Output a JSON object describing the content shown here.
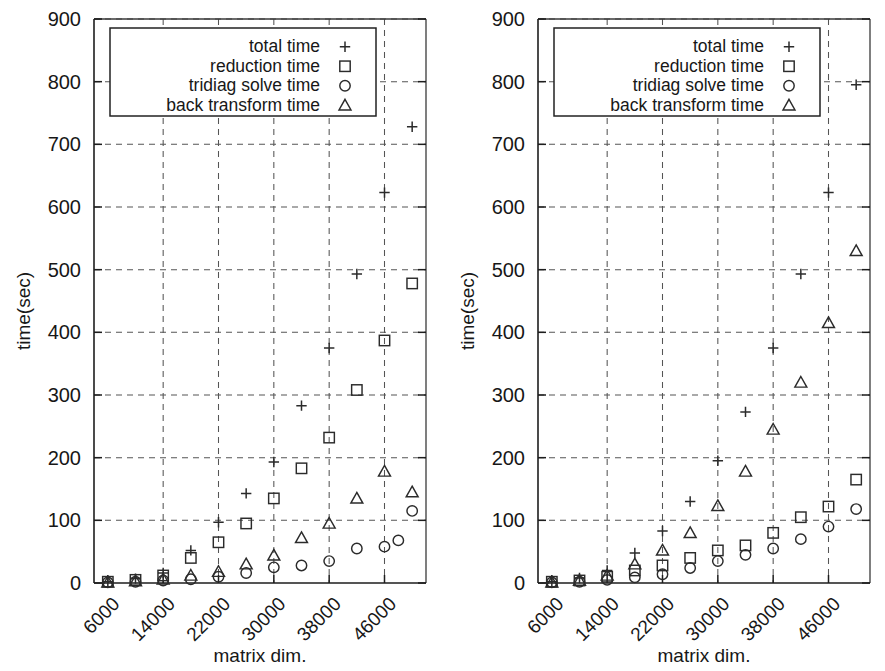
{
  "figure": {
    "panel_count": 2,
    "background_color": "#ffffff",
    "ink_color": "#1d1d1d"
  },
  "series_names": [
    "total time",
    "reduction time",
    "tridiag solve time",
    "back transform time"
  ],
  "series_markers": [
    "plus-marker",
    "square-marker",
    "circle-marker",
    "triangle-marker"
  ],
  "chart_data": [
    {
      "type": "scatter",
      "title": "",
      "xlabel": "matrix dim.",
      "ylabel": "time(sec)",
      "xlim": [
        4000,
        52000
      ],
      "ylim": [
        0,
        900
      ],
      "xticks": [
        6000,
        14000,
        22000,
        30000,
        38000,
        46000
      ],
      "yticks": [
        0,
        100,
        200,
        300,
        400,
        500,
        600,
        700,
        800,
        900
      ],
      "xtick_labels": [
        "6000",
        "14000",
        "22000",
        "30000",
        "38000",
        "46000"
      ],
      "ytick_labels": [
        "0",
        "100",
        "200",
        "300",
        "400",
        "500",
        "600",
        "700",
        "800",
        "900"
      ],
      "grid": true,
      "legend_position": "top-center",
      "legend_entries": [
        "total time",
        "reduction time",
        "tridiag solve time",
        "back transform time"
      ],
      "x": [
        6000,
        10000,
        14000,
        18000,
        22000,
        26000,
        30000,
        34000,
        38000,
        42000,
        46000,
        50000
      ],
      "series": [
        {
          "name": "total time",
          "marker": "plus-marker",
          "values": [
            2,
            6,
            14,
            30,
            52,
            95,
            143,
            193,
            283,
            375,
            493,
            623,
            728
          ]
        },
        {
          "name": "reduction time",
          "marker": "square-marker",
          "values": [
            2,
            5,
            11,
            22,
            40,
            65,
            95,
            135,
            183,
            232,
            308,
            387,
            478
          ]
        },
        {
          "name": "tridiag solve time",
          "marker": "circle-marker",
          "values": [
            1,
            2,
            4,
            6,
            9,
            13,
            19,
            26,
            31,
            38,
            55,
            58,
            68,
            115
          ]
        },
        {
          "name": "back transform time",
          "marker": "triangle-marker",
          "values": [
            1,
            3,
            6,
            10,
            16,
            22,
            30,
            44,
            72,
            95,
            135,
            178,
            145
          ]
        }
      ],
      "points": [
        {
          "series": 0,
          "x": 6000,
          "y": 2
        },
        {
          "series": 0,
          "x": 10000,
          "y": 7
        },
        {
          "series": 0,
          "x": 14000,
          "y": 16
        },
        {
          "series": 0,
          "x": 18000,
          "y": 52
        },
        {
          "series": 0,
          "x": 22000,
          "y": 97
        },
        {
          "series": 0,
          "x": 26000,
          "y": 143
        },
        {
          "series": 0,
          "x": 30000,
          "y": 193
        },
        {
          "series": 0,
          "x": 34000,
          "y": 283
        },
        {
          "series": 0,
          "x": 38000,
          "y": 375
        },
        {
          "series": 0,
          "x": 42000,
          "y": 493
        },
        {
          "series": 0,
          "x": 46000,
          "y": 623
        },
        {
          "series": 0,
          "x": 50000,
          "y": 728
        },
        {
          "series": 1,
          "x": 6000,
          "y": 2
        },
        {
          "series": 1,
          "x": 10000,
          "y": 5
        },
        {
          "series": 1,
          "x": 14000,
          "y": 12
        },
        {
          "series": 1,
          "x": 18000,
          "y": 40
        },
        {
          "series": 1,
          "x": 22000,
          "y": 65
        },
        {
          "series": 1,
          "x": 26000,
          "y": 95
        },
        {
          "series": 1,
          "x": 30000,
          "y": 135
        },
        {
          "series": 1,
          "x": 34000,
          "y": 183
        },
        {
          "series": 1,
          "x": 38000,
          "y": 232
        },
        {
          "series": 1,
          "x": 42000,
          "y": 308
        },
        {
          "series": 1,
          "x": 46000,
          "y": 387
        },
        {
          "series": 1,
          "x": 50000,
          "y": 478
        },
        {
          "series": 2,
          "x": 6000,
          "y": 1
        },
        {
          "series": 2,
          "x": 10000,
          "y": 2
        },
        {
          "series": 2,
          "x": 14000,
          "y": 4
        },
        {
          "series": 2,
          "x": 18000,
          "y": 6
        },
        {
          "series": 2,
          "x": 22000,
          "y": 10
        },
        {
          "series": 2,
          "x": 26000,
          "y": 16
        },
        {
          "series": 2,
          "x": 30000,
          "y": 25
        },
        {
          "series": 2,
          "x": 34000,
          "y": 28
        },
        {
          "series": 2,
          "x": 38000,
          "y": 35
        },
        {
          "series": 2,
          "x": 42000,
          "y": 55
        },
        {
          "series": 2,
          "x": 46000,
          "y": 58
        },
        {
          "series": 2,
          "x": 48000,
          "y": 68
        },
        {
          "series": 2,
          "x": 50000,
          "y": 115
        },
        {
          "series": 3,
          "x": 6000,
          "y": 1
        },
        {
          "series": 3,
          "x": 10000,
          "y": 3
        },
        {
          "series": 3,
          "x": 14000,
          "y": 6
        },
        {
          "series": 3,
          "x": 18000,
          "y": 12
        },
        {
          "series": 3,
          "x": 22000,
          "y": 18
        },
        {
          "series": 3,
          "x": 26000,
          "y": 30
        },
        {
          "series": 3,
          "x": 30000,
          "y": 44
        },
        {
          "series": 3,
          "x": 34000,
          "y": 72
        },
        {
          "series": 3,
          "x": 38000,
          "y": 95
        },
        {
          "series": 3,
          "x": 42000,
          "y": 135
        },
        {
          "series": 3,
          "x": 46000,
          "y": 178
        },
        {
          "series": 3,
          "x": 50000,
          "y": 145
        }
      ]
    },
    {
      "type": "scatter",
      "title": "",
      "xlabel": "matrix dim.",
      "ylabel": "time(sec)",
      "xlim": [
        4000,
        52000
      ],
      "ylim": [
        0,
        900
      ],
      "xticks": [
        6000,
        14000,
        22000,
        30000,
        38000,
        46000
      ],
      "yticks": [
        0,
        100,
        200,
        300,
        400,
        500,
        600,
        700,
        800,
        900
      ],
      "xtick_labels": [
        "6000",
        "14000",
        "22000",
        "30000",
        "38000",
        "46000"
      ],
      "ytick_labels": [
        "0",
        "100",
        "200",
        "300",
        "400",
        "500",
        "600",
        "700",
        "800",
        "900"
      ],
      "grid": true,
      "legend_position": "top-center",
      "legend_entries": [
        "total time",
        "reduction time",
        "tridiag solve time",
        "back transform time"
      ],
      "x": [
        6000,
        10000,
        14000,
        18000,
        22000,
        26000,
        30000,
        34000,
        38000,
        42000,
        46000,
        50000
      ],
      "series": [
        {
          "name": "total time",
          "marker": "plus-marker",
          "values": [
            2,
            8,
            18,
            45,
            83,
            130,
            195,
            273,
            375,
            493,
            623,
            795
          ]
        },
        {
          "name": "reduction time",
          "marker": "square-marker",
          "values": [
            2,
            4,
            9,
            18,
            28,
            40,
            52,
            60,
            80,
            105,
            122,
            165
          ]
        },
        {
          "name": "tridiag solve time",
          "marker": "circle-marker",
          "values": [
            1,
            2,
            4,
            8,
            12,
            22,
            35,
            45,
            55,
            70,
            90,
            118
          ]
        },
        {
          "name": "back transform time",
          "marker": "triangle-marker",
          "values": [
            1,
            3,
            10,
            28,
            50,
            80,
            123,
            178,
            245,
            320,
            415,
            530
          ]
        }
      ],
      "points": [
        {
          "series": 0,
          "x": 6000,
          "y": 2
        },
        {
          "series": 0,
          "x": 10000,
          "y": 8
        },
        {
          "series": 0,
          "x": 14000,
          "y": 20
        },
        {
          "series": 0,
          "x": 18000,
          "y": 48
        },
        {
          "series": 0,
          "x": 22000,
          "y": 83
        },
        {
          "series": 0,
          "x": 26000,
          "y": 130
        },
        {
          "series": 0,
          "x": 30000,
          "y": 195
        },
        {
          "series": 0,
          "x": 34000,
          "y": 273
        },
        {
          "series": 0,
          "x": 38000,
          "y": 375
        },
        {
          "series": 0,
          "x": 42000,
          "y": 493
        },
        {
          "series": 0,
          "x": 46000,
          "y": 623
        },
        {
          "series": 0,
          "x": 50000,
          "y": 795
        },
        {
          "series": 1,
          "x": 6000,
          "y": 2
        },
        {
          "series": 1,
          "x": 10000,
          "y": 4
        },
        {
          "series": 1,
          "x": 14000,
          "y": 10
        },
        {
          "series": 1,
          "x": 18000,
          "y": 20
        },
        {
          "series": 1,
          "x": 22000,
          "y": 28
        },
        {
          "series": 1,
          "x": 26000,
          "y": 40
        },
        {
          "series": 1,
          "x": 30000,
          "y": 52
        },
        {
          "series": 1,
          "x": 34000,
          "y": 60
        },
        {
          "series": 1,
          "x": 38000,
          "y": 80
        },
        {
          "series": 1,
          "x": 42000,
          "y": 105
        },
        {
          "series": 1,
          "x": 46000,
          "y": 122
        },
        {
          "series": 1,
          "x": 50000,
          "y": 165
        },
        {
          "series": 2,
          "x": 6000,
          "y": 1
        },
        {
          "series": 2,
          "x": 10000,
          "y": 2
        },
        {
          "series": 2,
          "x": 14000,
          "y": 5
        },
        {
          "series": 2,
          "x": 18000,
          "y": 9
        },
        {
          "series": 2,
          "x": 22000,
          "y": 14
        },
        {
          "series": 2,
          "x": 26000,
          "y": 24
        },
        {
          "series": 2,
          "x": 30000,
          "y": 35
        },
        {
          "series": 2,
          "x": 34000,
          "y": 45
        },
        {
          "series": 2,
          "x": 38000,
          "y": 55
        },
        {
          "series": 2,
          "x": 42000,
          "y": 70
        },
        {
          "series": 2,
          "x": 46000,
          "y": 90
        },
        {
          "series": 2,
          "x": 50000,
          "y": 118
        },
        {
          "series": 3,
          "x": 6000,
          "y": 1
        },
        {
          "series": 3,
          "x": 10000,
          "y": 4
        },
        {
          "series": 3,
          "x": 14000,
          "y": 12
        },
        {
          "series": 3,
          "x": 18000,
          "y": 30
        },
        {
          "series": 3,
          "x": 22000,
          "y": 52
        },
        {
          "series": 3,
          "x": 26000,
          "y": 80
        },
        {
          "series": 3,
          "x": 30000,
          "y": 123
        },
        {
          "series": 3,
          "x": 34000,
          "y": 178
        },
        {
          "series": 3,
          "x": 38000,
          "y": 245
        },
        {
          "series": 3,
          "x": 42000,
          "y": 320
        },
        {
          "series": 3,
          "x": 46000,
          "y": 415
        },
        {
          "series": 3,
          "x": 50000,
          "y": 530
        }
      ]
    }
  ]
}
